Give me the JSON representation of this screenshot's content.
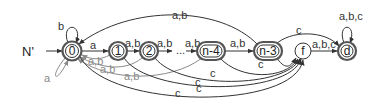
{
  "diagram": {
    "title": "N'",
    "colors": {
      "edge": "#333333",
      "back_edge": "#8a8a8a",
      "node_stroke": "#555555"
    },
    "nodes": [
      {
        "id": "0",
        "label": "0",
        "shape": "circle",
        "accepting": true,
        "initial": true
      },
      {
        "id": "1",
        "label": "1",
        "shape": "circle",
        "accepting": true
      },
      {
        "id": "2",
        "label": "2",
        "shape": "circle",
        "accepting": true
      },
      {
        "id": "n-4",
        "label": "n-4",
        "shape": "pill",
        "accepting": true
      },
      {
        "id": "n-3",
        "label": "n-3",
        "shape": "pill",
        "accepting": true
      },
      {
        "id": "f",
        "label": "f",
        "shape": "circle",
        "accepting": false
      },
      {
        "id": "d",
        "label": "d",
        "shape": "circle",
        "accepting": true
      }
    ],
    "ellipsis": "...",
    "edges": {
      "self_0_top": "b",
      "self_0_bottom": "a",
      "e_0_1": "a",
      "e_1_2": "a,b",
      "e_2_dots": "a,b",
      "e_dots_n4": "a,b",
      "e_n4_n3": "a,b",
      "e_n3_0": "a,b",
      "e_1_0": "a,b",
      "e_2_0": "a,b",
      "e_n4_0": "a,b",
      "e_n3_d": "c",
      "e_n3_f": "c",
      "e_n4_f": "c",
      "e_2_f": "c",
      "e_1_f": "c",
      "e_0_f": "c",
      "e_f_d": "a,b,c",
      "self_d": "a,b,c"
    }
  }
}
